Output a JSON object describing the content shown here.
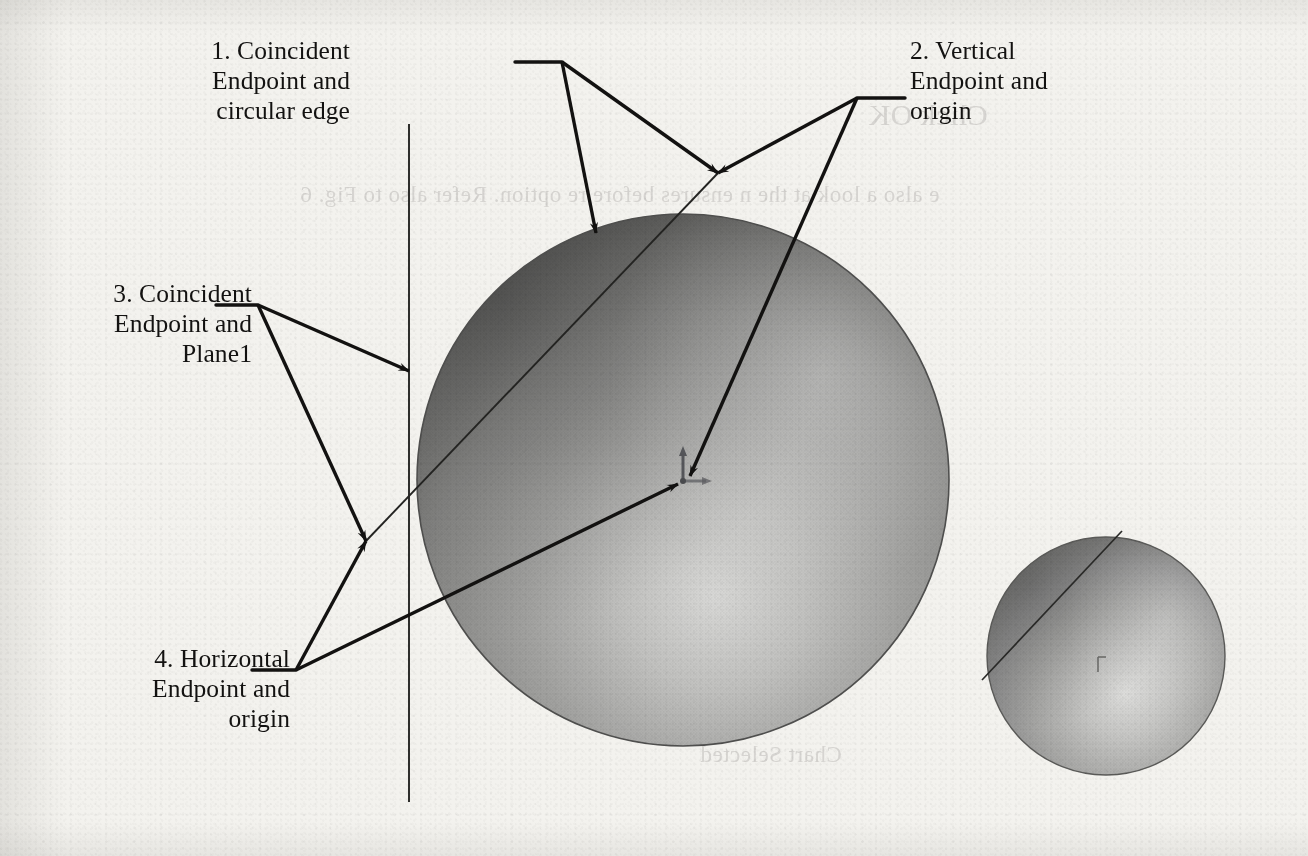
{
  "page": {
    "kind": "scanned-textbook-figure",
    "background_color": "#f3f2ee",
    "ink_color": "#131211",
    "width": 1308,
    "height": 856
  },
  "callouts": [
    {
      "id": 1,
      "number": "1.",
      "text": "1. Coincident\nEndpoint and\ncircular edge",
      "align": "right",
      "x": 60,
      "y": 36,
      "width": 290,
      "anchor": {
        "x": 562,
        "y": 62
      },
      "targets": [
        {
          "x": 596,
          "y": 233,
          "name": "sphere-top-left-edge"
        },
        {
          "x": 718,
          "y": 173,
          "name": "sketch-line-upper-endpoint"
        }
      ]
    },
    {
      "id": 2,
      "number": "2.",
      "text": "2. Vertical\nEndpoint and\norigin",
      "align": "left",
      "x": 910,
      "y": 36,
      "width": 280,
      "anchor": {
        "x": 857,
        "y": 98
      },
      "targets": [
        {
          "x": 718,
          "y": 173,
          "name": "sketch-line-upper-endpoint"
        },
        {
          "x": 690,
          "y": 476,
          "name": "sphere-origin"
        }
      ]
    },
    {
      "id": 3,
      "number": "3.",
      "text": "3. Coincident\nEndpoint and\nPlane1",
      "align": "right",
      "x": -12,
      "y": 279,
      "width": 264,
      "anchor": {
        "x": 258,
        "y": 305
      },
      "targets": [
        {
          "x": 409,
          "y": 371,
          "name": "plane1-vertical-line"
        },
        {
          "x": 366,
          "y": 541,
          "name": "sketch-line-lower-endpoint"
        }
      ]
    },
    {
      "id": 4,
      "number": "4.",
      "text": "4. Horizontal\nEndpoint and\norigin",
      "align": "right",
      "x": 22,
      "y": 644,
      "width": 268,
      "anchor": {
        "x": 296,
        "y": 670
      },
      "targets": [
        {
          "x": 366,
          "y": 541,
          "name": "sketch-line-lower-endpoint"
        },
        {
          "x": 678,
          "y": 484,
          "name": "sphere-origin"
        }
      ]
    }
  ],
  "geometry": {
    "large_sphere": {
      "name": "large-sphere",
      "cx": 683,
      "cy": 480,
      "r": 266,
      "highlight": {
        "x": 716,
        "y": 596,
        "r": 150
      },
      "rim_color": "#4a4a4a",
      "body_color": "#8e8e8e"
    },
    "small_sphere": {
      "name": "small-sphere",
      "cx": 1106,
      "cy": 656,
      "r": 119,
      "highlight": {
        "x": 1124,
        "y": 706,
        "r": 72
      }
    },
    "plane1_line": {
      "name": "plane1-vertical-line",
      "x": 409,
      "y1": 124,
      "y2": 802
    },
    "sketch_line_large": {
      "name": "sketch-line-large-sphere",
      "x1": 366,
      "y1": 541,
      "x2": 718,
      "y2": 173
    },
    "sketch_line_small": {
      "name": "sketch-line-small-sphere",
      "x1": 982,
      "y1": 680,
      "x2": 1122,
      "y2": 531
    },
    "origin_marker_large": {
      "name": "origin-marker-large",
      "x": 683,
      "y": 480
    },
    "origin_marker_small": {
      "name": "origin-marker-small",
      "x": 1098,
      "y": 664
    }
  },
  "bleed_through": [
    {
      "text": "Click OK",
      "x": 868,
      "y": 98,
      "size": 30
    },
    {
      "text": "e also a look at the n  ensures before re option. Refer also to Fig. 6",
      "x": 300,
      "y": 182,
      "size": 23
    },
    {
      "text": "Chart Selected",
      "x": 700,
      "y": 742,
      "size": 23
    }
  ]
}
